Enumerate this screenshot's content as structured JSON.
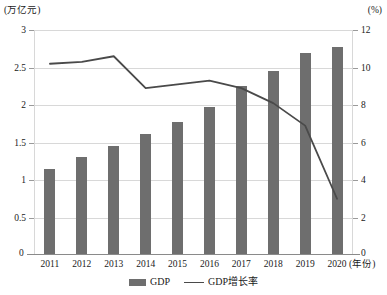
{
  "chart_data": {
    "type": "bar",
    "title": "",
    "subtitle": "",
    "xlabel": "(年份)",
    "ylabel": "(万亿元)",
    "y2label": "(%)",
    "categories": [
      "2011",
      "2012",
      "2013",
      "2014",
      "2015",
      "2016",
      "2017",
      "2018",
      "2019",
      "2020"
    ],
    "ylim": [
      0,
      3
    ],
    "yticks": [
      "0",
      "0.5",
      "1",
      "1.5",
      "2",
      "2.5",
      "3"
    ],
    "y2lim": [
      0,
      12
    ],
    "y2ticks": [
      "0",
      "2",
      "4",
      "6",
      "8",
      "10",
      "12"
    ],
    "grid": true,
    "legend_position": "bottom-center",
    "series": [
      {
        "name": "GDP",
        "type": "bar",
        "axis": "left",
        "unit": "万亿元",
        "color": "#6e6e6e",
        "values": [
          1.15,
          1.31,
          1.45,
          1.62,
          1.78,
          1.97,
          2.25,
          2.45,
          2.7,
          2.78
        ]
      },
      {
        "name": "GDP增长率",
        "type": "line",
        "axis": "right",
        "unit": "%",
        "color": "#4a4a4a",
        "values": [
          10.2,
          10.3,
          10.6,
          8.9,
          9.1,
          9.3,
          8.9,
          8.1,
          6.9,
          3.0
        ]
      }
    ]
  },
  "axes": {
    "left_caption": "(万亿元)",
    "right_caption": "(%)",
    "x_caption": "(年份)",
    "zero_left": "0",
    "zero_right": "0"
  },
  "legend": {
    "items": [
      {
        "label": "GDP",
        "marker": "bar-swatch"
      },
      {
        "label": "GDP增长率",
        "marker": "line-swatch"
      }
    ]
  }
}
